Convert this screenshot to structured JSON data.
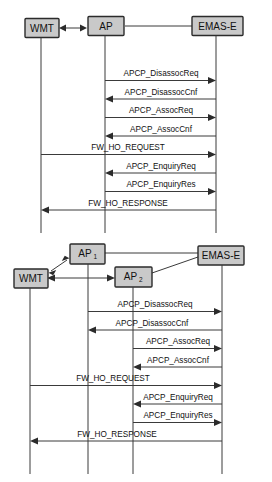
{
  "page": {
    "background_color": "#ffffff",
    "box_fill_color": "#c9c9c9",
    "box_border_color": "#2b2b2b",
    "line_color": "#3a3a3a",
    "text_color": "#111111"
  },
  "diagram_top": {
    "name": "single-ap-handover-sequence",
    "participants": [
      {
        "id": "wmt",
        "label": "WMT",
        "sub": "",
        "lifeline_x": 41
      },
      {
        "id": "ap",
        "label": "AP",
        "sub": "",
        "lifeline_x": 105
      },
      {
        "id": "emase",
        "label": "EMAS-E",
        "sub": "",
        "lifeline_x": 216
      }
    ],
    "messages": [
      {
        "index": 1,
        "label": "APCP_DisassocReq",
        "from": "ap",
        "to": "emase",
        "direction": "right"
      },
      {
        "index": 2,
        "label": "APCP_DisassocCnf",
        "from": "emase",
        "to": "ap",
        "direction": "left"
      },
      {
        "index": 3,
        "label": "APCP_AssocReq",
        "from": "ap",
        "to": "emase",
        "direction": "right"
      },
      {
        "index": 4,
        "label": "APCP_AssocCnf",
        "from": "emase",
        "to": "ap",
        "direction": "left"
      },
      {
        "index": 5,
        "label": "FW_HO_REQUEST",
        "from": "wmt",
        "to": "emase",
        "direction": "right"
      },
      {
        "index": 6,
        "label": "APCP_EnquiryReq",
        "from": "emase",
        "to": "ap",
        "direction": "left"
      },
      {
        "index": 7,
        "label": "APCP_EnquiryRes",
        "from": "ap",
        "to": "emase",
        "direction": "right"
      },
      {
        "index": 8,
        "label": "FW_HO_RESPONSE",
        "from": "emase",
        "to": "wmt",
        "direction": "left"
      }
    ],
    "header_links": [
      {
        "from": "wmt",
        "to": "ap",
        "style": "double-arrow"
      },
      {
        "from": "ap",
        "to": "emase",
        "style": "plain"
      }
    ]
  },
  "diagram_bottom": {
    "name": "dual-ap-handover-sequence",
    "participants": [
      {
        "id": "wmt",
        "label": "WMT",
        "sub": "",
        "lifeline_x": 30
      },
      {
        "id": "ap1",
        "label": "AP",
        "sub": "1",
        "lifeline_x": 88
      },
      {
        "id": "ap2",
        "label": "AP",
        "sub": "2",
        "lifeline_x": 133
      },
      {
        "id": "emase",
        "label": "EMAS-E",
        "sub": "",
        "lifeline_x": 222
      }
    ],
    "messages": [
      {
        "index": 1,
        "label": "APCP_DisassocReq",
        "from": "ap1",
        "to": "emase",
        "direction": "right"
      },
      {
        "index": 2,
        "label": "APCP_DisassocCnf",
        "from": "emase",
        "to": "ap1",
        "direction": "left"
      },
      {
        "index": 3,
        "label": "APCP_AssocReq",
        "from": "ap2",
        "to": "emase",
        "direction": "right"
      },
      {
        "index": 4,
        "label": "APCP_AssocCnf",
        "from": "emase",
        "to": "ap2",
        "direction": "left"
      },
      {
        "index": 5,
        "label": "FW_HO_REQUEST",
        "from": "wmt",
        "to": "emase",
        "direction": "right"
      },
      {
        "index": 6,
        "label": "APCP_EnquiryReq",
        "from": "emase",
        "to": "ap2",
        "direction": "left"
      },
      {
        "index": 7,
        "label": "APCP_EnquiryRes",
        "from": "ap2",
        "to": "emase",
        "direction": "right"
      },
      {
        "index": 8,
        "label": "FW_HO_RESPONSE",
        "from": "emase",
        "to": "wmt",
        "direction": "left"
      }
    ],
    "header_links": [
      {
        "from": "wmt",
        "to": "ap1",
        "style": "double-arrow-diagonal"
      },
      {
        "from": "wmt",
        "to": "ap2",
        "style": "double-arrow-horizontal"
      },
      {
        "from": "ap1",
        "to": "emase",
        "style": "plain"
      },
      {
        "from": "ap2",
        "to": "emase",
        "style": "plain-diagonal"
      }
    ]
  }
}
